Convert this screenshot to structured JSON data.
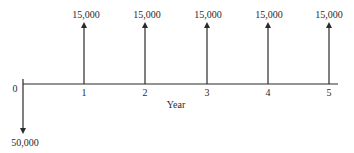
{
  "diagram": {
    "type": "cash-flow-diagram",
    "axis_label": "Year",
    "colors": {
      "line": "#2a2a2a",
      "text": "#2a2a2a",
      "background": "#ffffff"
    },
    "periods": [
      {
        "year": "0",
        "amount": "50,000",
        "direction": "down"
      },
      {
        "year": "1",
        "amount": "15,000",
        "direction": "up"
      },
      {
        "year": "2",
        "amount": "15,000",
        "direction": "up"
      },
      {
        "year": "3",
        "amount": "15,000",
        "direction": "up"
      },
      {
        "year": "4",
        "amount": "15,000",
        "direction": "up"
      },
      {
        "year": "5",
        "amount": "15,000",
        "direction": "up"
      }
    ]
  }
}
